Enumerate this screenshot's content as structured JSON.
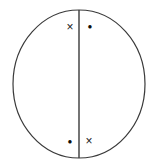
{
  "figure": {
    "background_color": "#ffffff",
    "width": 158,
    "height": 168
  },
  "shapes": {
    "circle": {
      "name": "circle-outline",
      "center_x": 79,
      "center_y": 84,
      "radius_x": 66,
      "radius_y": 74,
      "stroke_color": "#3a3a3a",
      "stroke_width": 1.2,
      "fill": "none"
    },
    "divider": {
      "name": "vertical-diameter-line",
      "x": 79,
      "y1": 10,
      "y2": 158,
      "stroke_color": "#3a3a3a",
      "stroke_width": 1.4
    }
  },
  "markers": [
    {
      "id": "top-left-cross",
      "symbol": "×",
      "type": "cross",
      "x": 70,
      "y": 27,
      "size": 12,
      "color": "#1a1a1a",
      "region": "upper-left"
    },
    {
      "id": "top-right-dot",
      "symbol": "●",
      "type": "dot",
      "x": 90,
      "y": 26,
      "size": 8,
      "color": "#0d0d0d",
      "region": "upper-right"
    },
    {
      "id": "bottom-left-dot",
      "symbol": "●",
      "type": "dot",
      "x": 70,
      "y": 141,
      "size": 8,
      "color": "#0d0d0d",
      "region": "lower-left"
    },
    {
      "id": "bottom-right-cross",
      "symbol": "×",
      "type": "cross",
      "x": 89,
      "y": 141,
      "size": 12,
      "color": "#1a1a1a",
      "region": "lower-right"
    }
  ]
}
